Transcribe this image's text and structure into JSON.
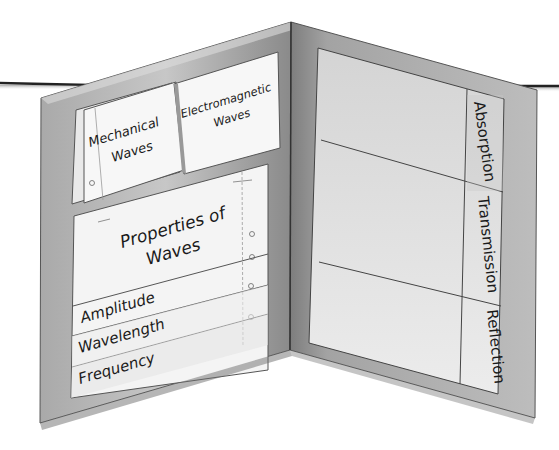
{
  "figure": {
    "type": "foldable-illustration",
    "colors": {
      "cover_dark": "#8c8c8c",
      "cover_mid": "#b3b3b3",
      "cover_light": "#cfcfcf",
      "paper": "#f7f7f7",
      "paper_shade": "#e4e4e4",
      "line": "#4a4a4a"
    }
  },
  "left_panel": {
    "top_flaps": [
      {
        "line1": "Mechanical",
        "line2": "Waves"
      },
      {
        "line1": "Electromagnetic",
        "line2": "Waves"
      }
    ],
    "layered_book": {
      "title_line1": "Properties of",
      "title_line2": "Waves",
      "tabs": [
        "Amplitude",
        "Wavelength",
        "Frequency"
      ]
    }
  },
  "right_panel": {
    "rows": [
      "Absorption",
      "Transmission",
      "Reflection"
    ]
  }
}
